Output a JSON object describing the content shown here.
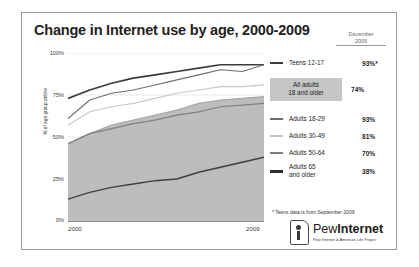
{
  "figure": {
    "title": "Change in Internet use by age, 2000-2009",
    "date_header_line1": "December",
    "date_header_line2": "2009",
    "footnote": "* Teens data is from September 2009"
  },
  "axes": {
    "y_label": "% of age group online",
    "y_ticks": [
      "100%",
      "75%",
      "50%",
      "25%",
      "0%"
    ],
    "x_ticks": [
      "2000",
      "2009"
    ]
  },
  "legend": {
    "rows": [
      {
        "label": "Teens 12-17",
        "value": "93%*",
        "swatch": "line-dark-thick"
      },
      {
        "label": "Adults 18-29",
        "value": "93%",
        "swatch": "line-mid"
      },
      {
        "label": "Adults 30-49",
        "value": "81%",
        "swatch": "line-light"
      },
      {
        "label": "Adults 50-64",
        "value": "70%",
        "swatch": "line-mid-dark"
      },
      {
        "label": "Adults 65\nand older",
        "value": "38%",
        "swatch": "line-darkest"
      }
    ],
    "highlight": {
      "label_line1": "All adults",
      "label_line2": "18 and older",
      "value": "74%"
    }
  },
  "logo": {
    "name_light": "Pew",
    "name_bold": "Internet",
    "tagline": "Pew Internet & American Life Project"
  },
  "chart_data": {
    "type": "line",
    "title": "Change in Internet use by age, 2000-2009",
    "xlabel": "",
    "ylabel": "% of age group online",
    "ylim": [
      0,
      100
    ],
    "grid": true,
    "legend_position": "right",
    "x": [
      2000,
      2001,
      2002,
      2003,
      2004,
      2005,
      2006,
      2007,
      2008,
      2009
    ],
    "series": [
      {
        "name": "Teens 12-17",
        "final_value": 93,
        "values": [
          73,
          78,
          82,
          85,
          87,
          89,
          91,
          93,
          93,
          93
        ],
        "color": "#3b3b3b",
        "width": 1.7,
        "type": "line"
      },
      {
        "name": "All adults 18 and older",
        "final_value": 74,
        "values": [
          46,
          52,
          57,
          60,
          63,
          66,
          70,
          72,
          73,
          74
        ],
        "color": "#bdbdbd",
        "width": 1.3,
        "type": "area"
      },
      {
        "name": "Adults 18-29",
        "final_value": 93,
        "values": [
          61,
          72,
          76,
          78,
          81,
          84,
          87,
          90,
          89,
          93
        ],
        "color": "#6e6e6e",
        "width": 1.1,
        "type": "line"
      },
      {
        "name": "Adults 30-49",
        "final_value": 81,
        "values": [
          57,
          65,
          68,
          70,
          73,
          76,
          78,
          80,
          80,
          81
        ],
        "color": "#c9c9c9",
        "width": 1.1,
        "type": "line"
      },
      {
        "name": "Adults 50-64",
        "final_value": 70,
        "values": [
          46,
          52,
          55,
          58,
          60,
          63,
          65,
          68,
          69,
          70
        ],
        "color": "#808080",
        "width": 1.2,
        "type": "line"
      },
      {
        "name": "Adults 65 and older",
        "final_value": 38,
        "values": [
          13,
          17,
          20,
          22,
          24,
          25,
          29,
          32,
          35,
          38
        ],
        "color": "#3f3f3f",
        "width": 1.4,
        "type": "line"
      }
    ]
  }
}
